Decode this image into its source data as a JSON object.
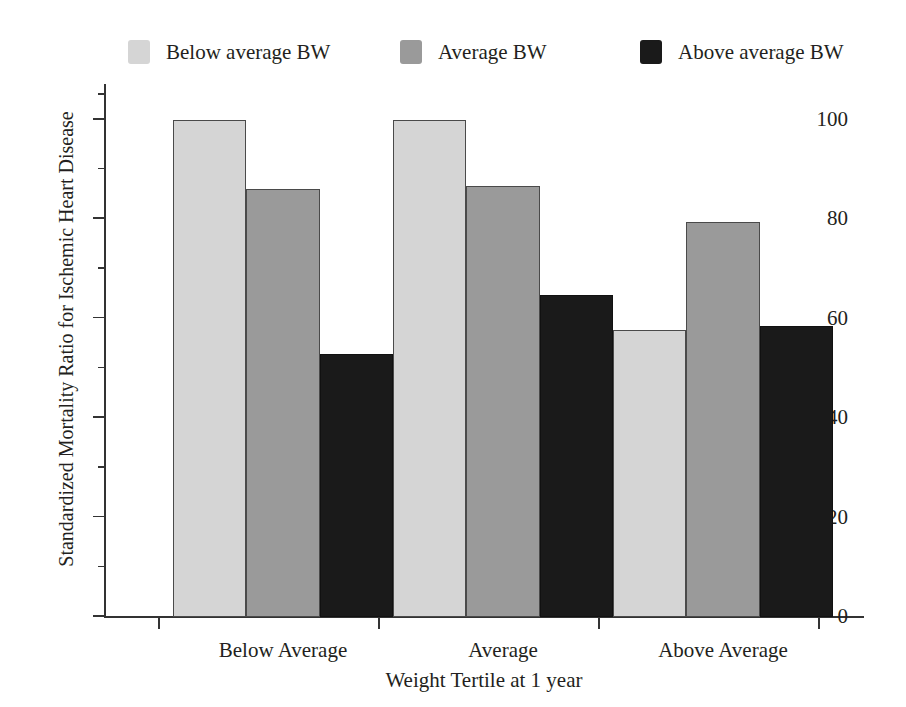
{
  "chart_data": {
    "type": "bar",
    "title": "",
    "subtitle": "",
    "xlabel": "Weight Tertile at 1 year",
    "ylabel": "Standardized Mortality Ratio for Ischemic Heart Disease",
    "categories": [
      "Below Average",
      "Average",
      "Above Average"
    ],
    "series": [
      {
        "name": "Below average BW",
        "color": "#d5d5d5",
        "values": [
          100,
          100,
          57.8
        ]
      },
      {
        "name": "Average BW",
        "color": "#9a9a9a",
        "values": [
          86,
          86.7,
          79.5
        ]
      },
      {
        "name": "Above average BW",
        "color": "#1a1a1a",
        "values": [
          53,
          64.8,
          58.5
        ]
      }
    ],
    "ylim": [
      0,
      107
    ],
    "ytick_values": [
      0,
      20,
      40,
      60,
      80,
      100
    ],
    "ytick_labels": [
      "0",
      "20",
      "40",
      "60",
      "80",
      "100"
    ],
    "yminor_tick_values": [
      10,
      30,
      50,
      70,
      90,
      105
    ],
    "grid": false,
    "legend_position": "top",
    "legend": [
      {
        "label": "Below average BW",
        "color": "#d5d5d5"
      },
      {
        "label": "Average BW",
        "color": "#9a9a9a"
      },
      {
        "label": "Above average BW",
        "color": "#1a1a1a"
      }
    ]
  },
  "axis": {
    "y_title": "Standardized Mortality Ratio for Ischemic Heart Disease",
    "x_title": "Weight Tertile at 1 year"
  }
}
